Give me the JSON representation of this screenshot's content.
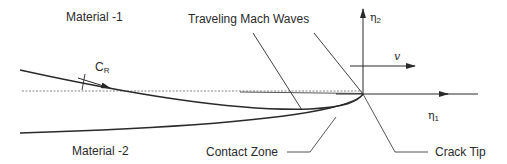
{
  "labels": {
    "material_1": "Material -1",
    "material_2": "Material -2",
    "mach_waves": "Traveling Mach Waves",
    "contact_zone": "Contact Zone",
    "crack_tip": "Crack Tip"
  },
  "symbols": {
    "cr_base": "C",
    "cr_sub": "R",
    "eta1_base": "η",
    "eta1_sub": "1",
    "eta2_base": "η",
    "eta2_sub": "2",
    "velocity": "v"
  },
  "colors": {
    "line": "#2a2a2a",
    "dashed": "#555555",
    "background": "#ffffff"
  }
}
